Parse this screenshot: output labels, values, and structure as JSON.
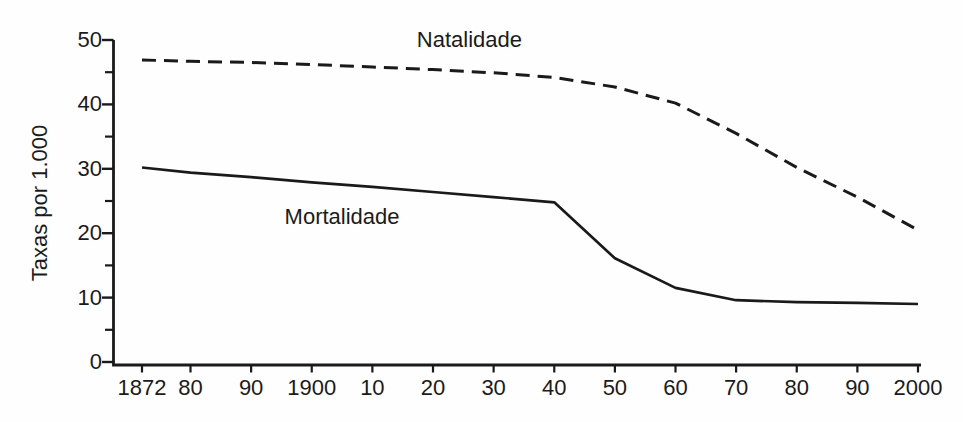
{
  "colors": {
    "background": "#fefefe",
    "ink": "#1a1a1a"
  },
  "chart_data": {
    "type": "line",
    "title": "",
    "xlabel": "",
    "ylabel": "Taxas por 1.000",
    "xlim": [
      1872,
      2000
    ],
    "ylim": [
      0,
      50
    ],
    "grid": false,
    "legend_position": "inline-labels",
    "x": [
      1872,
      1880,
      1890,
      1900,
      1910,
      1920,
      1930,
      1940,
      1950,
      1960,
      1970,
      1980,
      1990,
      2000
    ],
    "x_tick_labels": [
      "1872",
      "80",
      "90",
      "1900",
      "10",
      "20",
      "30",
      "40",
      "50",
      "60",
      "70",
      "80",
      "90",
      "2000"
    ],
    "y_major_ticks": [
      0,
      10,
      20,
      30,
      40,
      50
    ],
    "y_minor_ticks": [
      5,
      15,
      25,
      35,
      45
    ],
    "series": [
      {
        "name": "Natalidade",
        "line_style": "dashed",
        "values": [
          46.9,
          46.7,
          46.5,
          46.2,
          45.8,
          45.4,
          44.9,
          44.2,
          42.7,
          40.2,
          35.5,
          30.2,
          25.6,
          20.5
        ]
      },
      {
        "name": "Mortalidade",
        "line_style": "solid",
        "values": [
          30.2,
          29.4,
          28.7,
          27.9,
          27.2,
          26.4,
          25.6,
          24.8,
          16.1,
          11.5,
          9.6,
          9.3,
          9.2,
          9.0
        ]
      }
    ],
    "annotations": [
      {
        "text": "Natalidade",
        "x": 1926,
        "y": 50.0
      },
      {
        "text": "Mortalidade",
        "x": 1905,
        "y": 22.5
      }
    ]
  }
}
